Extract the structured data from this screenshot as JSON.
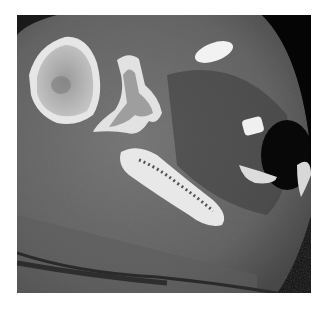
{
  "image": {
    "kind": "axial CT scan",
    "region": "shoulder",
    "colors": {
      "background": "#ffffff",
      "air": "#0a0a0a",
      "soft_tissue": "#6e6e6e",
      "bone": "#e8e8e8"
    }
  }
}
